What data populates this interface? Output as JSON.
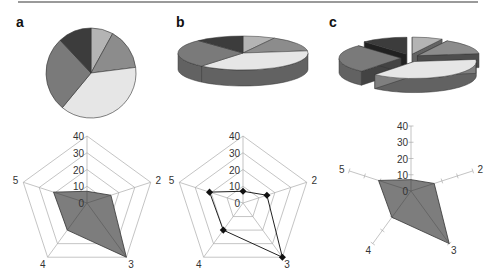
{
  "panels": [
    {
      "label": "a",
      "pie_style": "2D",
      "radar_style": "filled polygon on pentagon grid"
    },
    {
      "label": "b",
      "pie_style": "3D",
      "radar_style": "line with markers on pentagon grid"
    },
    {
      "label": "c",
      "pie_style": "3D exploded",
      "radar_style": "filled polygon on axes only"
    }
  ],
  "colors": {
    "slice_1": "#b4b4b4",
    "slice_2": "#8c8c8c",
    "slice_3": "#e6e6e6",
    "slice_4": "#7a7a7a",
    "slice_5": "#3c3c3c",
    "radar_fill": "#7d7d7d",
    "grid": "#aaaaaa"
  },
  "radar_axes": [
    "1",
    "2",
    "3",
    "4",
    "5"
  ],
  "radar_axis_labels": {
    "a2": "2",
    "a3": "3",
    "a4": "4",
    "a5": "5"
  },
  "radar_ticks": [
    "0",
    "10",
    "20",
    "30",
    "40"
  ],
  "chart_data": [
    {
      "type": "pie",
      "title": "a (2D pie)",
      "categories": [
        "1",
        "2",
        "3",
        "4",
        "5"
      ],
      "values": [
        8,
        15,
        38,
        27,
        12
      ]
    },
    {
      "type": "radar",
      "title": "a (filled radar)",
      "categories": [
        "1",
        "2",
        "3",
        "4",
        "5"
      ],
      "values": [
        7,
        15,
        40,
        20,
        21
      ],
      "rlim": [
        0,
        40
      ],
      "ticks": [
        0,
        10,
        20,
        30,
        40
      ]
    },
    {
      "type": "pie",
      "title": "b (3D pie)",
      "categories": [
        "1",
        "2",
        "3",
        "4",
        "5"
      ],
      "values": [
        8,
        15,
        38,
        27,
        12
      ]
    },
    {
      "type": "radar",
      "title": "b (line radar with markers)",
      "categories": [
        "1",
        "2",
        "3",
        "4",
        "5"
      ],
      "values": [
        7,
        15,
        40,
        20,
        21
      ],
      "rlim": [
        0,
        40
      ],
      "ticks": [
        0,
        10,
        20,
        30,
        40
      ]
    },
    {
      "type": "pie",
      "title": "c (3D exploded pie)",
      "categories": [
        "1",
        "2",
        "3",
        "4",
        "5"
      ],
      "values": [
        8,
        15,
        38,
        27,
        12
      ]
    },
    {
      "type": "radar",
      "title": "c (filled radar, axes only)",
      "categories": [
        "1",
        "2",
        "3",
        "4",
        "5"
      ],
      "values": [
        7,
        15,
        40,
        20,
        21
      ],
      "rlim": [
        0,
        40
      ],
      "ticks": [
        0,
        10,
        20,
        30,
        40
      ]
    }
  ]
}
